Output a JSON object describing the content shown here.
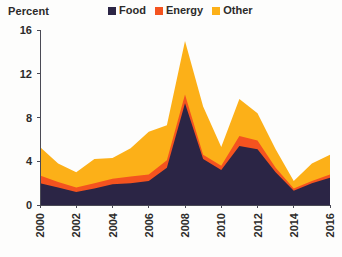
{
  "header": {
    "unit_label": "Percent"
  },
  "legend": {
    "position": "top-right",
    "items": [
      {
        "label": "Food",
        "color": "#2b2545"
      },
      {
        "label": "Energy",
        "color": "#f4531f"
      },
      {
        "label": "Other",
        "color": "#fcb018"
      }
    ]
  },
  "chart_data": {
    "type": "area",
    "stacked": true,
    "title": "",
    "subtitle": "",
    "xlabel": "",
    "ylabel": "Percent",
    "grid": false,
    "legend_position": "top-right",
    "x": [
      2000,
      2001,
      2002,
      2003,
      2004,
      2005,
      2006,
      2007,
      2008,
      2009,
      2010,
      2011,
      2012,
      2013,
      2014,
      2015,
      2016
    ],
    "xtick_labels": [
      "2000",
      "2002",
      "2004",
      "2006",
      "2008",
      "2010",
      "2012",
      "2014",
      "2016"
    ],
    "xtick_values": [
      2000,
      2002,
      2004,
      2006,
      2008,
      2010,
      2012,
      2014,
      2016
    ],
    "xlim": [
      2000,
      2016
    ],
    "ytick_labels": [
      "0",
      "4",
      "8",
      "12",
      "16"
    ],
    "ytick_values": [
      0,
      4,
      8,
      12,
      16
    ],
    "ylim": [
      0,
      16
    ],
    "series": [
      {
        "name": "Food",
        "color": "#2b2545",
        "values": [
          2.0,
          1.6,
          1.2,
          1.5,
          1.9,
          2.0,
          2.2,
          3.4,
          9.3,
          4.2,
          3.2,
          5.4,
          5.1,
          3.0,
          1.3,
          2.0,
          2.5
        ]
      },
      {
        "name": "Energy",
        "color": "#f4531f",
        "values": [
          0.7,
          0.5,
          0.4,
          0.5,
          0.5,
          0.6,
          0.6,
          0.7,
          0.8,
          0.4,
          0.4,
          0.9,
          0.8,
          0.4,
          0.2,
          0.2,
          0.3
        ]
      },
      {
        "name": "Other",
        "color": "#fcb018",
        "values": [
          2.6,
          1.7,
          1.4,
          2.2,
          1.9,
          2.6,
          3.9,
          3.2,
          4.9,
          4.4,
          1.7,
          3.4,
          2.5,
          1.7,
          0.7,
          1.6,
          1.8
        ]
      }
    ],
    "totals": [
      5.3,
      3.8,
      3.0,
      4.2,
      4.3,
      5.2,
      6.7,
      7.3,
      15.0,
      9.0,
      5.3,
      9.7,
      8.4,
      5.1,
      2.2,
      3.8,
      4.6
    ]
  }
}
